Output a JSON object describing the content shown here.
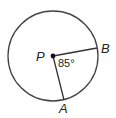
{
  "diagram": {
    "type": "circle-central-angle",
    "center": {
      "label": "P",
      "x": 53,
      "y": 56
    },
    "radius": 45,
    "points": [
      {
        "label": "B",
        "x": 97,
        "y": 48
      },
      {
        "label": "A",
        "x": 64,
        "y": 100
      }
    ],
    "angle": {
      "value": "85°",
      "between": [
        "B",
        "A"
      ],
      "vertex": "P"
    },
    "colors": {
      "stroke": "#333333",
      "text": "#222222",
      "background": "#ffffff"
    }
  }
}
